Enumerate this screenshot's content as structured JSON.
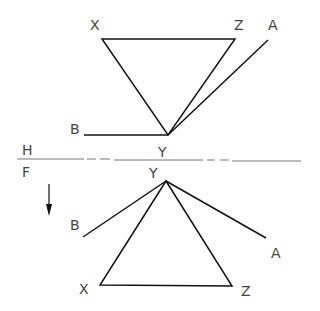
{
  "diagram": {
    "type": "orthographic projection",
    "reference_line": {
      "top_label": "H",
      "bottom_label": "F"
    },
    "top_view": {
      "labels": {
        "x": "X",
        "z": "Z",
        "a": "A",
        "b": "B",
        "y": "Y"
      }
    },
    "front_view": {
      "labels": {
        "y": "Y",
        "b": "B",
        "a": "A",
        "x": "X",
        "z": "Z"
      }
    },
    "arrow": "down-arrow"
  }
}
